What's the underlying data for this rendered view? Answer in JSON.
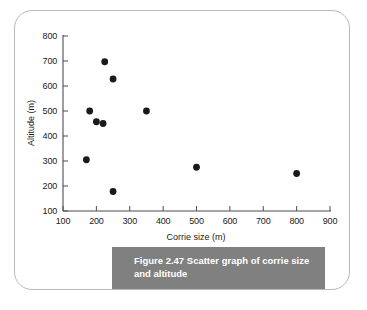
{
  "figure": {
    "caption": "Figure 2.47  Scatter graph of corrie size and altitude",
    "caption_color": "#808080",
    "caption_text_color": "#ffffff",
    "frame_color": "#b9b9b9"
  },
  "chart_data": {
    "type": "scatter",
    "title": "",
    "xlabel": "Corrie size (m)",
    "ylabel": "Altitude (m)",
    "xlim": [
      100,
      900
    ],
    "ylim": [
      100,
      800
    ],
    "xticks": [
      100,
      200,
      300,
      400,
      500,
      600,
      700,
      800,
      900
    ],
    "yticks": [
      100,
      200,
      300,
      400,
      500,
      600,
      700,
      800
    ],
    "xtick_labels": [
      "100",
      "200",
      "300",
      "400",
      "500",
      "600",
      "700",
      "800",
      "900"
    ],
    "ytick_labels": [
      "100",
      "200",
      "300",
      "400",
      "500",
      "600",
      "700",
      "800"
    ],
    "grid": false,
    "legend": null,
    "marker_color": "#1a1a1a",
    "marker_size": 3.4,
    "points": [
      {
        "x": 170,
        "y": 305
      },
      {
        "x": 180,
        "y": 500
      },
      {
        "x": 200,
        "y": 457
      },
      {
        "x": 220,
        "y": 450
      },
      {
        "x": 225,
        "y": 697
      },
      {
        "x": 250,
        "y": 628
      },
      {
        "x": 250,
        "y": 178
      },
      {
        "x": 350,
        "y": 500
      },
      {
        "x": 500,
        "y": 275
      },
      {
        "x": 800,
        "y": 250
      }
    ]
  }
}
